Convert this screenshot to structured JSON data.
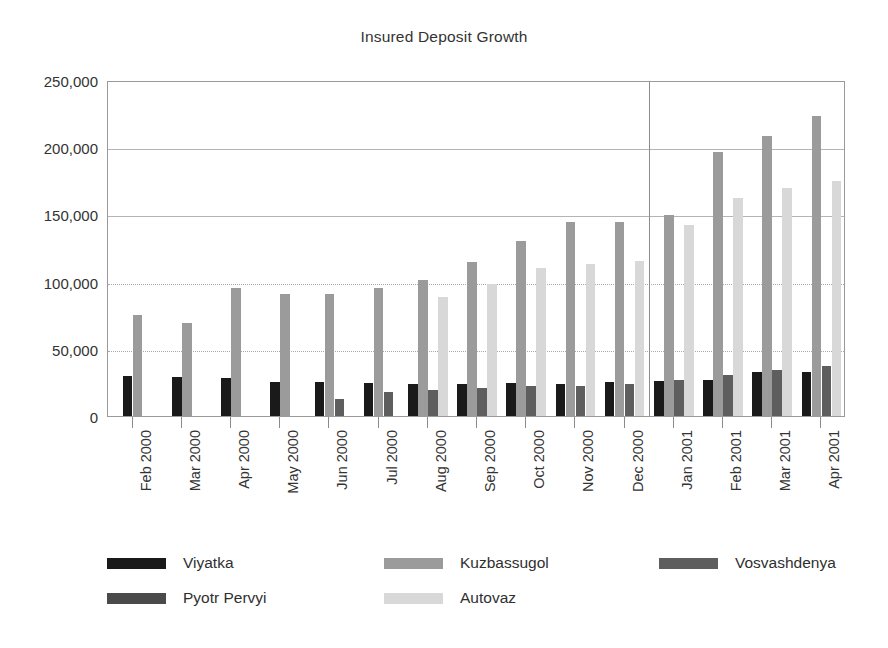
{
  "chart_data": {
    "type": "bar",
    "title": "Insured Deposit Growth",
    "xlabel": "",
    "ylabel": "",
    "ylim": [
      0,
      250000
    ],
    "yticks": [
      0,
      50000,
      100000,
      150000,
      200000,
      250000
    ],
    "ytick_labels": [
      "0",
      "50,000",
      "100,000",
      "150,000",
      "200,000",
      "250,000"
    ],
    "grid": true,
    "legend_position": "bottom",
    "categories": [
      "Feb 2000",
      "Mar 2000",
      "Apr 2000",
      "May 2000",
      "Jun 2000",
      "Jul 2000",
      "Aug 2000",
      "Sep 2000",
      "Oct 2000",
      "Nov 2000",
      "Dec 2000",
      "Jan 2001",
      "Feb 2001",
      "Mar 2001",
      "Apr 2001"
    ],
    "series": [
      {
        "name": "Viyatka",
        "color": "#1a1a1a",
        "values": [
          30000,
          29000,
          28000,
          25500,
          25500,
          24500,
          24000,
          24000,
          24500,
          24000,
          25500,
          26000,
          26500,
          32500,
          33000
        ]
      },
      {
        "name": "Kuzbassugol",
        "color": "#9b9b9b",
        "values": [
          75000,
          69000,
          95500,
          91000,
          90500,
          95000,
          101500,
          114500,
          130500,
          144500,
          144000,
          149500,
          196500,
          208000,
          223500
        ]
      },
      {
        "name": "Vosvashdenya",
        "color": "#5e5e5e",
        "values": [
          0,
          0,
          0,
          0,
          13000,
          18000,
          19000,
          20500,
          22500,
          22500,
          23500,
          26500,
          30500,
          34000,
          37500
        ]
      },
      {
        "name": "Pyotr Pervyi",
        "color": "#4a4a4a",
        "values": [
          0,
          0,
          0,
          0,
          0,
          0,
          0,
          0,
          0,
          0,
          0,
          0,
          0,
          0,
          0
        ]
      },
      {
        "name": "Autovaz",
        "color": "#d8d8d8",
        "values": [
          0,
          0,
          0,
          0,
          0,
          0,
          88500,
          98500,
          110000,
          113000,
          115000,
          142000,
          162500,
          169500,
          175000
        ]
      }
    ]
  },
  "legend": {
    "items": [
      {
        "label": "Viyatka",
        "color": "#1a1a1a"
      },
      {
        "label": "Kuzbassugol",
        "color": "#9b9b9b"
      },
      {
        "label": "Vosvashdenya",
        "color": "#5e5e5e"
      },
      {
        "label": "Pyotr Pervyi",
        "color": "#4a4a4a"
      },
      {
        "label": "Autovaz",
        "color": "#d8d8d8"
      }
    ]
  }
}
